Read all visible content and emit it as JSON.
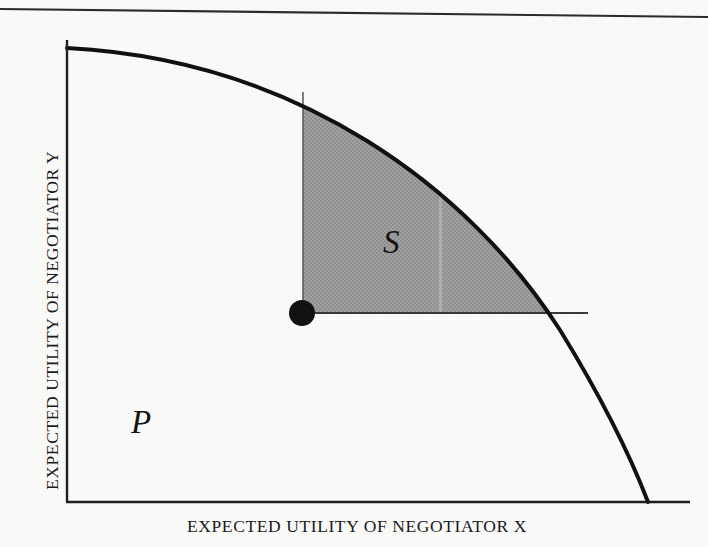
{
  "figure": {
    "type": "diagram",
    "background_color": "#fbfbfa",
    "ink_color": "#111111",
    "shade_color": "#9a9a9a",
    "top_rule": {
      "name": "page-rule",
      "x1": 0,
      "y1": 9,
      "x2": 708,
      "y2": 17,
      "width": 2.2
    },
    "axes": {
      "origin": {
        "x": 67,
        "y": 502
      },
      "y_axis": {
        "x": 67,
        "y_top": 40,
        "y_bottom": 502
      },
      "x_axis": {
        "y": 502,
        "x_left": 67,
        "x_right": 690
      },
      "stroke_width": 2.4,
      "x_title": "EXPECTED UTILITY OF NEGOTIATOR X",
      "y_title": "EXPECTED UTILITY OF NEGOTIATOR Y"
    },
    "pareto_frontier": {
      "name": "pareto-frontier-curve",
      "start": {
        "x": 67,
        "y": 48
      },
      "end": {
        "x": 648,
        "y": 502
      },
      "stroke_width": 4.0,
      "description": "concave efficient frontier bounding the feasible set P"
    },
    "disagreement_point": {
      "name": "disagreement-point",
      "x": 302,
      "y": 313,
      "radius": 13,
      "fill": "#111111"
    },
    "shaded_region": {
      "name": "bargaining-set-S",
      "label": "S",
      "corner": {
        "x": 303,
        "y": 313
      },
      "top_on_curve": {
        "x": 303,
        "y": 92
      },
      "right_on_curve": {
        "x": 587,
        "y": 313
      },
      "fill": "#9c9c9c",
      "streak_x": 441
    },
    "feasible_region": {
      "name": "feasible-set-P",
      "label": "P"
    },
    "labels": {
      "S": "S",
      "P": "P"
    }
  }
}
